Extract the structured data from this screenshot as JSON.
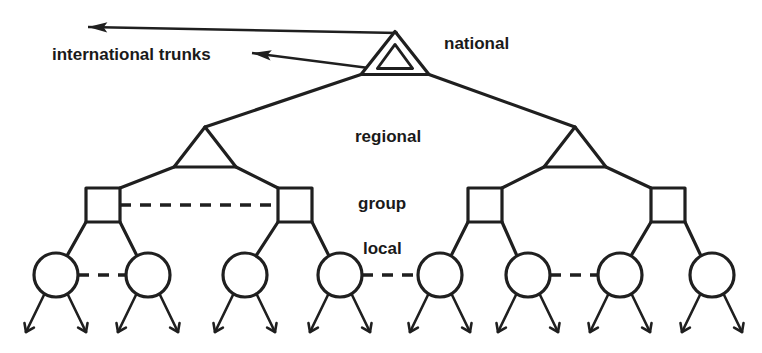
{
  "diagram": {
    "background_color": "#ffffff",
    "line_color": "#1f1f1f",
    "labels": {
      "international_trunks": "international trunks",
      "national": "national",
      "regional": "regional",
      "group": "group",
      "local": "local"
    },
    "label_positions": {
      "international_trunks": {
        "x": 52,
        "y": 56
      },
      "national": {
        "x": 444,
        "y": 45
      },
      "regional": {
        "x": 355,
        "y": 138
      },
      "group": {
        "x": 358,
        "y": 205
      },
      "local": {
        "x": 363,
        "y": 250
      }
    },
    "levels": [
      {
        "name": "national",
        "shape": "double-triangle",
        "count": 1
      },
      {
        "name": "regional",
        "shape": "triangle",
        "count": 2
      },
      {
        "name": "group",
        "shape": "square",
        "count": 4
      },
      {
        "name": "local",
        "shape": "circle",
        "count": 8
      },
      {
        "name": "subscriber",
        "shape": "arrow-tick",
        "count": 16
      }
    ],
    "nodes": {
      "national": {
        "id": "national-exchange",
        "cx": 395,
        "cy": 53,
        "half_width": 34,
        "height": 43
      },
      "regional": [
        {
          "id": "regional-exchange-1",
          "cx": 205,
          "cy": 147,
          "half_width": 31,
          "height": 40
        },
        {
          "id": "regional-exchange-2",
          "cx": 575,
          "cy": 147,
          "half_width": 31,
          "height": 40
        }
      ],
      "group": [
        {
          "id": "group-exchange-1",
          "cx": 103,
          "cy": 205,
          "size": 34
        },
        {
          "id": "group-exchange-2",
          "cx": 295,
          "cy": 205,
          "size": 34
        },
        {
          "id": "group-exchange-3",
          "cx": 485,
          "cy": 205,
          "size": 34
        },
        {
          "id": "group-exchange-4",
          "cx": 668,
          "cy": 205,
          "size": 34
        }
      ],
      "local": [
        {
          "id": "local-exchange-1",
          "cx": 56,
          "cy": 275,
          "r": 22
        },
        {
          "id": "local-exchange-2",
          "cx": 148,
          "cy": 275,
          "r": 22
        },
        {
          "id": "local-exchange-3",
          "cx": 245,
          "cy": 275,
          "r": 22
        },
        {
          "id": "local-exchange-4",
          "cx": 340,
          "cy": 275,
          "r": 22
        },
        {
          "id": "local-exchange-5",
          "cx": 440,
          "cy": 275,
          "r": 22
        },
        {
          "id": "local-exchange-6",
          "cx": 528,
          "cy": 275,
          "r": 22
        },
        {
          "id": "local-exchange-7",
          "cx": 620,
          "cy": 275,
          "r": 22
        },
        {
          "id": "local-exchange-8",
          "cx": 712,
          "cy": 275,
          "r": 22
        }
      ]
    },
    "hierarchy_edges": [
      {
        "from": "national",
        "to": "regional-exchange-1"
      },
      {
        "from": "national",
        "to": "regional-exchange-2"
      },
      {
        "from": "regional-exchange-1",
        "to": "group-exchange-1"
      },
      {
        "from": "regional-exchange-1",
        "to": "group-exchange-2"
      },
      {
        "from": "regional-exchange-2",
        "to": "group-exchange-3"
      },
      {
        "from": "regional-exchange-2",
        "to": "group-exchange-4"
      },
      {
        "from": "group-exchange-1",
        "to": "local-exchange-1"
      },
      {
        "from": "group-exchange-1",
        "to": "local-exchange-2"
      },
      {
        "from": "group-exchange-2",
        "to": "local-exchange-3"
      },
      {
        "from": "group-exchange-2",
        "to": "local-exchange-4"
      },
      {
        "from": "group-exchange-3",
        "to": "local-exchange-5"
      },
      {
        "from": "group-exchange-3",
        "to": "local-exchange-6"
      },
      {
        "from": "group-exchange-4",
        "to": "local-exchange-7"
      },
      {
        "from": "group-exchange-4",
        "to": "local-exchange-8"
      }
    ],
    "peer_links": [
      {
        "id": "peer-link-group-1-2",
        "level": "group",
        "from": "group-exchange-1",
        "to": "group-exchange-2",
        "style": "dashed"
      },
      {
        "id": "peer-link-local-1-2",
        "level": "local",
        "from": "local-exchange-1",
        "to": "local-exchange-2",
        "style": "dashed"
      },
      {
        "id": "peer-link-local-4-5",
        "level": "local",
        "from": "local-exchange-4",
        "to": "local-exchange-5",
        "style": "dashed"
      },
      {
        "id": "peer-link-local-6-7",
        "level": "local",
        "from": "local-exchange-6",
        "to": "local-exchange-7",
        "style": "dashed"
      }
    ],
    "trunk_arrows": [
      {
        "id": "international-trunk-arrow-upper",
        "from": {
          "x": 398,
          "y": 33
        },
        "to": {
          "x": 88,
          "y": 27
        }
      },
      {
        "id": "international-trunk-arrow-lower",
        "from": {
          "x": 400,
          "y": 72
        },
        "to": {
          "x": 252,
          "y": 53
        }
      }
    ],
    "subscriber_lines": {
      "count_per_local": 2,
      "spread_x": 30,
      "drop_y": 57,
      "tick_style": "arrowhead"
    }
  }
}
